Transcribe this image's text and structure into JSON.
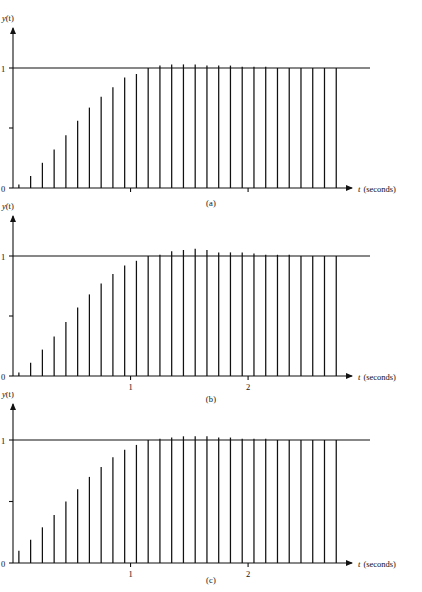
{
  "figure": {
    "background": "#ffffff",
    "ink_color": "#111111",
    "panel_count": 3
  },
  "axes": {
    "ylabel": "y(t)",
    "ylabel_variable": "y",
    "ylabel_arg": "(t)",
    "xlabel_variable": "t",
    "xlabel_units": "(seconds)",
    "y_ticks": [
      "0",
      "1"
    ],
    "y_tick_values": [
      0,
      0.5,
      1
    ],
    "y_tick_labeled": [
      "0",
      "",
      "1"
    ],
    "x_ticks": [
      "1",
      "2"
    ],
    "x_tick_values": [
      1,
      2
    ],
    "xlim": [
      0,
      2.85
    ],
    "ylim": [
      0,
      1.1
    ],
    "grid": false,
    "arrowheads": [
      "x-axis-right",
      "y-axis-up"
    ]
  },
  "captions": [
    {
      "id": "a",
      "text": "(a)"
    },
    {
      "id": "b",
      "text": "(b)"
    },
    {
      "id": "c",
      "text": "(c)"
    }
  ],
  "chart_data": [
    {
      "type": "line",
      "subtype": "stem",
      "title": "(a)",
      "xlabel": "t (seconds)",
      "ylabel": "y(t)",
      "xlim": [
        0,
        2.85
      ],
      "ylim": [
        0,
        1.1
      ],
      "grid": false,
      "legend": null,
      "reference_line": {
        "y": 1,
        "label": "1"
      },
      "sample_period": 0.1,
      "x": [
        0.05,
        0.15,
        0.25,
        0.35,
        0.45,
        0.55,
        0.65,
        0.75,
        0.85,
        0.95,
        1.05,
        1.15,
        1.25,
        1.35,
        1.45,
        1.55,
        1.65,
        1.75,
        1.85,
        1.95,
        2.05,
        2.15,
        2.25,
        2.35,
        2.45,
        2.55,
        2.65,
        2.75
      ],
      "values": [
        0.03,
        0.1,
        0.21,
        0.32,
        0.44,
        0.56,
        0.67,
        0.76,
        0.84,
        0.92,
        0.95,
        1.0,
        1.02,
        1.03,
        1.03,
        1.03,
        1.02,
        1.02,
        1.02,
        1.01,
        1.01,
        1.01,
        1.0,
        1.0,
        1.0,
        1.0,
        1.0,
        1.0
      ]
    },
    {
      "type": "line",
      "subtype": "stem",
      "title": "(b)",
      "xlabel": "t (seconds)",
      "ylabel": "y(t)",
      "xlim": [
        0,
        2.85
      ],
      "ylim": [
        0,
        1.1
      ],
      "grid": false,
      "legend": null,
      "reference_line": {
        "y": 1,
        "label": "1"
      },
      "sample_period": 0.1,
      "x": [
        0.05,
        0.15,
        0.25,
        0.35,
        0.45,
        0.55,
        0.65,
        0.75,
        0.85,
        0.95,
        1.05,
        1.15,
        1.25,
        1.35,
        1.45,
        1.55,
        1.65,
        1.75,
        1.85,
        1.95,
        2.05,
        2.15,
        2.25,
        2.35,
        2.45,
        2.55,
        2.65,
        2.75
      ],
      "values": [
        0.03,
        0.11,
        0.22,
        0.33,
        0.45,
        0.57,
        0.68,
        0.77,
        0.85,
        0.92,
        0.96,
        1.0,
        1.01,
        1.04,
        1.05,
        1.06,
        1.05,
        1.03,
        1.03,
        1.03,
        1.02,
        1.01,
        1.01,
        1.01,
        1.0,
        1.0,
        1.0,
        1.0
      ]
    },
    {
      "type": "line",
      "subtype": "stem",
      "title": "(c)",
      "xlabel": "t (seconds)",
      "ylabel": "y(t)",
      "xlim": [
        0,
        2.85
      ],
      "ylim": [
        0,
        1.1
      ],
      "grid": false,
      "legend": null,
      "reference_line": {
        "y": 1,
        "label": "1"
      },
      "sample_period": 0.1,
      "x": [
        0.05,
        0.15,
        0.25,
        0.35,
        0.45,
        0.55,
        0.65,
        0.75,
        0.85,
        0.95,
        1.05,
        1.15,
        1.25,
        1.35,
        1.45,
        1.55,
        1.65,
        1.75,
        1.85,
        1.95,
        2.05,
        2.15,
        2.25,
        2.35,
        2.45,
        2.55,
        2.65,
        2.75
      ],
      "values": [
        0.1,
        0.19,
        0.29,
        0.39,
        0.5,
        0.6,
        0.7,
        0.78,
        0.86,
        0.92,
        0.96,
        1.0,
        1.01,
        1.02,
        1.03,
        1.03,
        1.03,
        1.02,
        1.02,
        1.01,
        1.01,
        1.01,
        1.0,
        1.0,
        1.0,
        1.0,
        1.0,
        1.0
      ]
    }
  ]
}
